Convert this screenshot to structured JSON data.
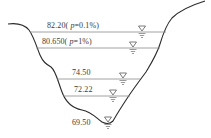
{
  "diagram": {
    "type": "river-cross-section",
    "water_levels": [
      {
        "id": "level-1",
        "label": "82.20",
        "suffix_open": "( ",
        "p_symbol": "p",
        "p_value": "=0.1%)",
        "y": 32,
        "x1": 30,
        "x2": 166,
        "marker_x": 142,
        "label_x": 47
      },
      {
        "id": "level-2",
        "label": "80.650",
        "suffix_open": "( ",
        "p_symbol": "p",
        "p_value": "=1%)",
        "y": 48,
        "x1": 36,
        "x2": 160,
        "marker_x": 133,
        "label_x": 42
      },
      {
        "id": "level-3",
        "label": "74.50",
        "suffix_open": "",
        "p_symbol": "",
        "p_value": "",
        "y": 79,
        "x1": 57,
        "x2": 140,
        "marker_x": 123,
        "label_x": 72
      },
      {
        "id": "level-4",
        "label": "72.22",
        "suffix_open": "",
        "p_symbol": "",
        "p_value": "",
        "y": 96,
        "x1": 63,
        "x2": 130,
        "marker_x": 113,
        "label_x": 74
      },
      {
        "id": "level-5",
        "label": "69.50",
        "suffix_open": "",
        "p_symbol": "",
        "p_value": "",
        "y": 123,
        "x1": 103,
        "x2": 112,
        "marker_x": 108,
        "label_x": 72
      }
    ],
    "colors": {
      "terrain": "#2a2a2a",
      "water_line": "#8a8a8a",
      "text": "#3a3a3a",
      "background": "#ffffff"
    }
  }
}
